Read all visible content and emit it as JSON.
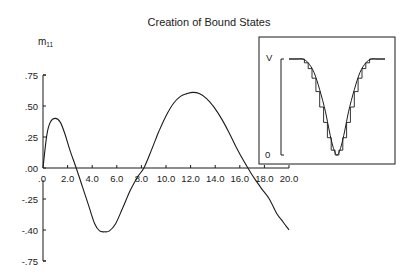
{
  "chart_data": {
    "type": "line",
    "title": "Creation of Bound States",
    "xlabel": "",
    "ylabel": "m11",
    "ylabel_display": {
      "base": "m",
      "subscript": "11"
    },
    "xlim": [
      0,
      20
    ],
    "ylim": [
      -0.75,
      0.75
    ],
    "grid": false,
    "legend": null,
    "x_ticks": [
      ".0",
      "2.0",
      "4.0",
      "6.0",
      "8.0",
      "10.0",
      "12.0",
      "14.0",
      "16.0",
      "18.0",
      "20.0"
    ],
    "x_tick_values": [
      0,
      2,
      4,
      6,
      8,
      10,
      12,
      14,
      16,
      18,
      20
    ],
    "y_ticks_upper": [
      ".75",
      ".50",
      ".25",
      ".00"
    ],
    "y_tick_values_upper": [
      0.75,
      0.5,
      0.25,
      0.0
    ],
    "y_ticks_lower": [
      "-.25",
      "-.40",
      "-.75"
    ],
    "y_tick_values_lower": [
      -0.25,
      -0.4,
      -0.75
    ],
    "series": [
      {
        "name": "m11",
        "x": [
          0.0,
          0.3,
          0.6,
          1.0,
          1.4,
          1.8,
          2.2,
          2.7,
          3.2,
          3.7,
          4.2,
          4.6,
          5.0,
          5.4,
          5.9,
          6.5,
          7.1,
          7.7,
          8.2,
          8.8,
          9.4,
          10.0,
          10.6,
          11.2,
          11.7,
          12.2,
          12.7,
          13.3,
          13.9,
          14.5,
          15.1,
          15.7,
          16.3,
          16.9,
          17.3,
          17.8,
          18.4,
          19.0,
          19.5,
          20.0
        ],
        "y": [
          0.0,
          0.26,
          0.37,
          0.4,
          0.37,
          0.27,
          0.14,
          0.0,
          -0.15,
          -0.28,
          -0.37,
          -0.41,
          -0.42,
          -0.41,
          -0.37,
          -0.29,
          -0.18,
          -0.07,
          0.0,
          0.14,
          0.29,
          0.42,
          0.52,
          0.58,
          0.6,
          0.61,
          0.6,
          0.56,
          0.49,
          0.4,
          0.29,
          0.17,
          0.06,
          -0.04,
          -0.1,
          -0.17,
          -0.25,
          -0.32,
          -0.36,
          -0.4
        ]
      }
    ],
    "inset": {
      "type": "line",
      "ylabel_top": "V",
      "ylabel_bottom": "0",
      "description": "Smooth potential well V(x) overlaid with a staircase (piecewise-constant) approximation",
      "smooth_series": {
        "x": [
          0,
          0.08,
          0.14,
          0.2,
          0.26,
          0.32,
          0.38,
          0.42,
          0.46,
          0.5,
          0.54,
          0.58,
          0.62,
          0.68,
          0.74,
          0.8,
          0.86,
          0.92,
          1.0
        ],
        "y": [
          1.0,
          1.0,
          1.0,
          0.96,
          0.86,
          0.68,
          0.45,
          0.25,
          0.08,
          0.0,
          0.08,
          0.25,
          0.45,
          0.68,
          0.86,
          0.96,
          1.0,
          1.0,
          1.0
        ]
      },
      "step_series": {
        "x_edges": [
          0,
          0.16,
          0.2,
          0.24,
          0.28,
          0.32,
          0.36,
          0.4,
          0.44,
          0.48,
          0.52,
          0.56,
          0.6,
          0.64,
          0.68,
          0.72,
          0.76,
          0.8,
          0.84,
          1.0
        ],
        "y": [
          1.0,
          0.96,
          0.9,
          0.8,
          0.66,
          0.5,
          0.34,
          0.18,
          0.05,
          0.0,
          0.05,
          0.18,
          0.34,
          0.5,
          0.66,
          0.8,
          0.9,
          0.96,
          1.0
        ]
      }
    }
  },
  "colors": {
    "ink": "#1a1a1a",
    "background": "#ffffff"
  }
}
